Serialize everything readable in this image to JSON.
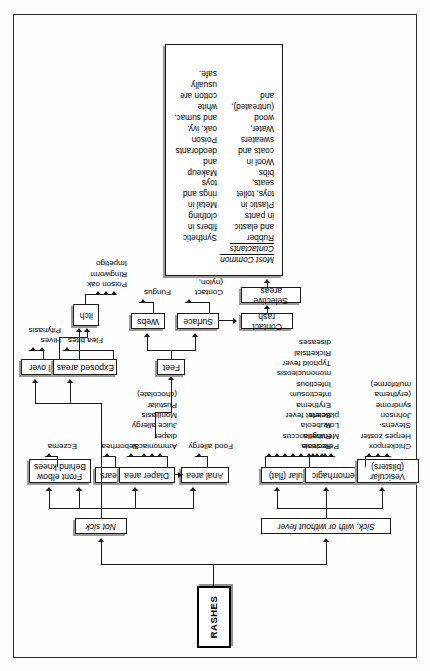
{
  "diagram": {
    "type": "flowchart",
    "title": "RASHES",
    "orientation": "rotated-90-ccw",
    "root_label": "RASHES",
    "branches": {
      "sick": {
        "label": "Sick, with or without fever",
        "children": [
          {
            "label": "Vesicular\n(blisters)",
            "leaves": "Chickenpox\nHerpes zoster\nStevens-Johnson\n  syndrome\n  (erythema multiforme)"
          },
          {
            "label": "Hemorrhagic",
            "leaves": "Petechiae\nMeningococcus\nLow platelets"
          },
          {
            "label": "Macular (flat)",
            "leaves": "Roseola\nRubella\nRubeola\nScarlet fever\nErythema infectiosum\nInfectious mononucleosis\nTyphoid fever\nRickettsial diseases"
          }
        ]
      },
      "not_sick": {
        "label": "Not sick",
        "children": [
          {
            "label": "Anal area",
            "leaves": "Food allergy"
          },
          {
            "label": "Diaper area",
            "leaves": "Ammoniacal\n  diaper\nJuice allergy\nMoniliasis\nPustular\n  (chocolate)"
          },
          {
            "label": "Behind ears",
            "leaves": "Seborrhea"
          },
          {
            "label": "Front elbow\nBehind knees",
            "leaves": "Eczema"
          },
          {
            "label": "Exposed areas",
            "leaves": "Flea bites",
            "sub": {
              "label": "itch",
              "leaves": "Poison oak\nRingworm\nImpetigo"
            }
          },
          {
            "label": "All over",
            "leaves": "Hives\nPityriasis"
          },
          {
            "label": "Feet",
            "children": [
              {
                "label": "Webs",
                "leaves": "Fungus"
              },
              {
                "label": "Surface",
                "leaves": "Contact\n  (nylon,\n  plastic)"
              }
            ]
          },
          {
            "label": "Contact rash",
            "children": [
              {
                "label": "Selective areas"
              }
            ]
          }
        ]
      }
    }
  },
  "nodes": {
    "rashes": "RASHES",
    "sick": "Sick, with or without fever",
    "not_sick": "Not sick",
    "vesicular": "Vesicular\n(blisters)",
    "hemorrhagic": "Hemorrhagic",
    "macular": "Macular (flat)",
    "anal_area": "Anal area",
    "diaper_area": "Diaper area",
    "behind_ears": "Behind ears",
    "elbow_knees": "Front elbow\nBehind knees",
    "exposed_areas": "Exposed areas",
    "all_over": "All over",
    "itch": "itch",
    "feet": "Feet",
    "webs": "Webs",
    "surface": "Surface",
    "contact_rash": "Contact rash",
    "selective_areas": "Selective areas"
  },
  "leaves": {
    "vesicular": "Chickenpox\nHerpes zoster\nStevens-Johnson\n   syndrome\n   (erythema multiforme)",
    "hemorrhagic": "Petechiae\nMeningococcus\nLow platelets",
    "macular": "Roseola\nRubella\nRubeola\nScarlet fever\nErythema infectiosum\nInfectious mononucleosis\nTyphoid fever\nRickettsial diseases",
    "anal_area": "Food allergy",
    "diaper_area": "Ammoniacal\n   diaper\nJuice allergy\nMoniliasis\nPustular\n   (chocolate)",
    "behind_ears": "Seborrhea",
    "elbow_knees": "Eczema",
    "exposed_areas": "Flea bites",
    "itch": "Poison oak\nRingworm\nImpetigo",
    "all_over": "Hives\nPityriasis",
    "webs": "Fungus",
    "surface": "Contact\n   (nylon,\n   plastic)"
  },
  "contactants": {
    "caption": "Most Common Contactants",
    "column_left": "Rubber and elastic in pants\nPlastic in toys, toilet seats,\n   bibs\nWool in coats and sweaters\nWater, wood (untreated), and",
    "column_right": "Synthetic fibers in clothing\nMetal in rings and toys\nMakeup and deodorants\nPoison oak, ivy, and sumac.\nwhite cotton are usually safe.",
    "items": [
      "Rubber and elastic in pants",
      "Plastic in toys, toilet seats, bibs",
      "Wool in coats and sweaters",
      "Synthetic fibers in clothing",
      "Metal in rings and toys",
      "Makeup and deodorants",
      "Poison oak, ivy, and sumac.",
      "Water, wood (untreated), and white cotton are usually safe."
    ]
  },
  "colors": {
    "ink": "#1a1a1a",
    "paper": "#fefefe",
    "shadow": "#9a9a9a"
  }
}
